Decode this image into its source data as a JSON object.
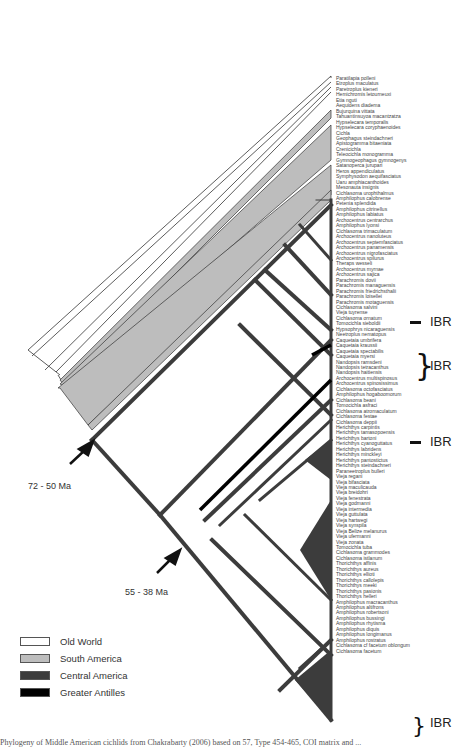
{
  "figure": {
    "legend": [
      {
        "label": "Old World",
        "color": "#ffffff"
      },
      {
        "label": "South America",
        "color": "#bdbdbd"
      },
      {
        "label": "Central America",
        "color": "#3c3c3c"
      },
      {
        "label": "Greater Antilles",
        "color": "#000000"
      }
    ],
    "age_labels": [
      {
        "label": "72 - 50 Ma"
      },
      {
        "label": "55 - 38 Ma"
      }
    ],
    "ibr_labels": [
      {
        "label": "IBR",
        "taxa": "Cichlasoma ornatum"
      },
      {
        "label": "IBR",
        "taxa": "Caquetaia kraussii / Caquetaia spectabilis / Caquetaia myersi"
      },
      {
        "label": "IBR",
        "taxa": "Cichlasoma festae"
      },
      {
        "label": "IBR",
        "taxa": "Cichlasoma cf facetum oblongum / Cichlasoma facetum"
      }
    ],
    "caption": "Phylogeny of Middle American cichlids from Chakrabarty (2006) based on 57, Type 454-465, COI matrix and ..."
  },
  "taxa": [
    "Paratilapia polleni",
    "Etroplus maculatus",
    "Paretroplus kieneri",
    "Hemichromis letourneuxi",
    "Etia nguti",
    "Aequidens diadema",
    "Bujurquina vittata",
    "Tahuantinsuyoa macantzatza",
    "Hypselecara temporalis",
    "Hypselecara coryphaenoides",
    "Cichla",
    "Geophagus steindachneri",
    "Apistogramma bitaeniata",
    "Crenicichla",
    "Teleocichla monogramma",
    "Gymnogeophagus gymnogenys",
    "Satanoperca jurupari",
    "Heros appendiculatus",
    "Symphysodon aequifasciatus",
    "Uaru amphiacanthoides",
    "Mesonauta insignis",
    "Cichlasoma urophthalmus",
    "Amphilophus calobrense",
    "Petenia splendida",
    "Amphilophus citrinellus",
    "Amphilophus labiatus",
    "Archocentrus centrarchus",
    "Amphilophus lyonsi",
    "Cichlasoma trimaculatum",
    "Archocentrus nanoluteus",
    "Archocentrus septemfasciatus",
    "Archocentrus panamensis",
    "Archocentrus nigrofasciatus",
    "Archocentrus spilurus",
    "Theraps wesseli",
    "Archocentrus myrnae",
    "Archocentrus sajica",
    "Parachromis dovii",
    "Parachromis managuensis",
    "Parachromis friedrichsthalii",
    "Parachromis loisellei",
    "Parachromis motaguensis",
    "Cichlasoma salvini",
    "Vieja tuyrense",
    "Cichlasoma ornatum",
    "Tomocichla sieboldii",
    "Hypsophrys nicaraguensis",
    "Neetroplus nematopus",
    "Caquetaia umbrifera",
    "Caquetaia kraussii",
    "Caquetaia spectabilis",
    "Caquetaia myersi",
    "Nandopsis ramsdeni",
    "Nandopsis tetracanthus",
    "Nandopsis haitiensis",
    "Archocentrus multispinosus",
    "Archocentrus spinosissimus",
    "Cichlasoma octofasciatus",
    "Amphilophus hogaboomorum",
    "Cichlasoma beani",
    "Tomocichla asfraci",
    "Cichlasoma atromaculatum",
    "Cichlasoma festae",
    "Cichlasoma deppii",
    "Herichthys carpintis",
    "Herichthys tamasopoensis",
    "Herichthys bartoni",
    "Herichthys cyanoguttatus",
    "Herichthys labridens",
    "Herichthys minckleyi",
    "Herichthys pantostictus",
    "Herichthys steindachneri",
    "Paraneetroplus bulleri",
    "Vieja regani",
    "Vieja bifasciata",
    "Vieja maculicauda",
    "Vieja breidohri",
    "Vieja fenestrata",
    "Vieja godmanni",
    "Vieja intermedia",
    "Vieja guttulata",
    "Vieja hartwegi",
    "Vieja synspila",
    "Vieja Belize melanurus",
    "Vieja ufermanni",
    "Vieja zonata",
    "Tomocichla tuba",
    "Cichlasoma grammodes",
    "Cichlasoma istlanum",
    "Thorichthys affinis",
    "Thorichthys aureus",
    "Thorichthys ellioti",
    "Thorichthys callolepis",
    "Thorichthys meeki",
    "Thorichthys pasionis",
    "Thorichthys helleri",
    "Amphilophus macracanthus",
    "Amphilophus altifrons",
    "Amphilophus robertsoni",
    "Amphilophus bussingi",
    "Amphilophus rhytisma",
    "Amphilophus diquis",
    "Amphilophus longimanus",
    "Amphilophus rostratus",
    "Cichlasoma cf facetum oblongum",
    "Cichlasoma facetum"
  ]
}
